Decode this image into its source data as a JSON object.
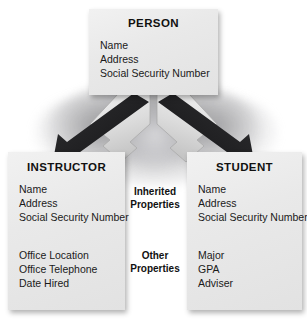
{
  "diagram": {
    "type": "inheritance-class-diagram",
    "background_color": "#ffffff",
    "box_fill_color": "#e9e9e9",
    "arrow_dark_color": "#2b2b2b",
    "arrow_light_color": "#d8d8d8"
  },
  "superclass": {
    "name": "person-class",
    "title": "PERSON",
    "attributes": [
      "Name",
      "Address",
      "Social Security Number"
    ]
  },
  "subclasses": [
    {
      "name": "instructor-class",
      "title": "INSTRUCTOR",
      "inherited_attributes": [
        "Name",
        "Address",
        "Social Security Number"
      ],
      "own_attributes": [
        "Office Location",
        "Office Telephone",
        "Date Hired"
      ]
    },
    {
      "name": "student-class",
      "title": "STUDENT",
      "inherited_attributes": [
        "Name",
        "Address",
        "Social Security Number"
      ],
      "own_attributes": [
        "Major",
        "GPA",
        "Adviser"
      ]
    }
  ],
  "annotations": {
    "inherited": {
      "line1": "Inherited",
      "line2": "Properties"
    },
    "other": {
      "line1": "Other",
      "line2": "Properties"
    }
  },
  "arrows": [
    {
      "name": "arrow-person-to-instructor",
      "direction": "down-left"
    },
    {
      "name": "arrow-person-to-student",
      "direction": "down-right"
    }
  ]
}
